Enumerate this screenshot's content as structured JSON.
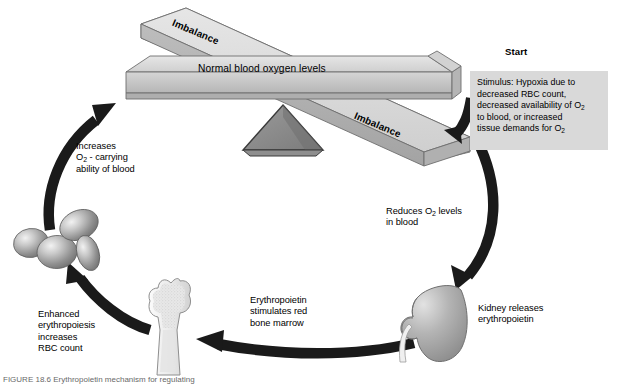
{
  "figure": {
    "caption": "FIGURE 18.6   Erythropoietin mechanism for regulating"
  },
  "start": {
    "heading": "Start",
    "stimulus_text": "Stimulus: Hypoxia due to\ndecreased RBC count,\ndecreased availability of  O2\nto blood, or increased\ntissue demands for O2",
    "stimulus_lines": [
      "Stimulus: Hypoxia due to",
      "decreased RBC count,",
      "decreased availability of  O",
      "to blood, or increased",
      "tissue demands for O"
    ],
    "box_color": "#d9d9d9"
  },
  "balance": {
    "beam_label": "Normal blood oxygen levels",
    "imbalance_left": "Imbalance",
    "imbalance_right": "Imbalance",
    "beam_color": "#c6c6c6",
    "beam_top_color": "#dcdcdc",
    "fulcrum_color": "#8c8c8c"
  },
  "steps": [
    {
      "id": "reduces-o2",
      "text": "Reduces O2 levels\nin blood",
      "lines": [
        "Reduces O",
        " levels",
        "in blood"
      ]
    },
    {
      "id": "kidney-releases",
      "text": "Kidney releases\nerythropoietin",
      "lines": [
        "Kidney releases",
        "erythropoietin"
      ]
    },
    {
      "id": "epo-stimulates",
      "text": "Erythropoietin\nstimulates red\nbone marrow",
      "lines": [
        "Erythropoietin",
        "stimulates red",
        "bone marrow"
      ]
    },
    {
      "id": "enhanced-erythropoiesis",
      "text": "Enhanced\nerythropoiesis\nincreases\nRBC count",
      "lines": [
        "Enhanced",
        "erythropoiesis",
        "increases",
        "RBC count"
      ]
    },
    {
      "id": "increases-o2-carrying",
      "text": "Increases\nO2 - carrying\nability of blood",
      "lines": [
        "Increases",
        "O",
        " - carrying",
        "ability of blood"
      ]
    }
  ],
  "organs": [
    {
      "id": "red-blood-cells",
      "name": "Red blood cells",
      "color": "#9a9a9a"
    },
    {
      "id": "bone-marrow",
      "name": "Femur with red bone marrow",
      "color": "#e9e9e9"
    },
    {
      "id": "kidney",
      "name": "Kidney",
      "color": "#a8a8a8"
    }
  ],
  "arrows": {
    "color": "#1a1a1a",
    "count": 5
  },
  "subscripts": {
    "o2": "2"
  }
}
